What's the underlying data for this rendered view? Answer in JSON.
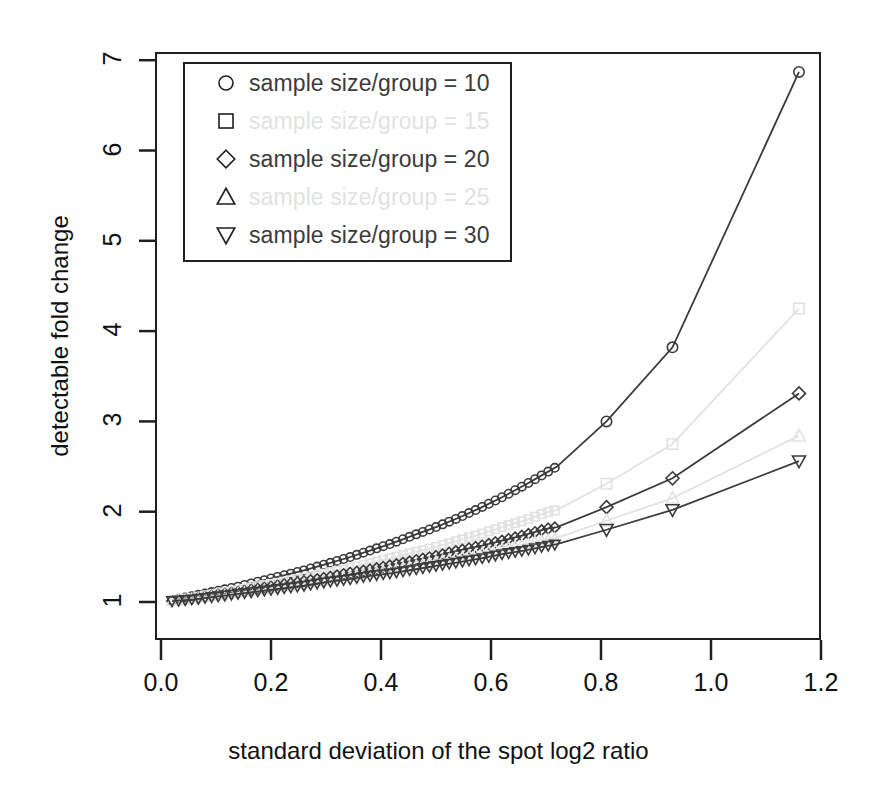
{
  "figure": {
    "title_fragment": "",
    "background": "#ffffff",
    "frame_color": "#1f1f1f"
  },
  "axes": {
    "x_title": "standard deviation of the spot log2 ratio",
    "y_title": "detectable fold change",
    "x_ticks": [
      "0.0",
      "0.2",
      "0.4",
      "0.6",
      "0.8",
      "1.0",
      "1.2"
    ],
    "y_ticks": [
      "1",
      "2",
      "3",
      "4",
      "5",
      "6",
      "7"
    ]
  },
  "legend": {
    "items": [
      {
        "symbol": "circle",
        "label": "sample size/group = 10",
        "color": "#3b3b3b",
        "faded": false
      },
      {
        "symbol": "square",
        "label": "sample size/group = 15",
        "color": "#e2e2e2",
        "faded": true
      },
      {
        "symbol": "diamond",
        "label": "sample size/group = 20",
        "color": "#3b3b3b",
        "faded": false
      },
      {
        "symbol": "triangle-up",
        "label": "sample size/group = 25",
        "color": "#e2e2e2",
        "faded": true
      },
      {
        "symbol": "triangle-down",
        "label": "sample size/group = 30",
        "color": "#3b3b3b",
        "faded": false
      }
    ]
  },
  "chart_data": {
    "type": "line",
    "title": "",
    "xlabel": "standard deviation of the spot log2 ratio",
    "ylabel": "detectable fold change",
    "xlim": [
      -0.02,
      1.22
    ],
    "ylim": [
      0.88,
      7.1
    ],
    "xticks": [
      0.0,
      0.2,
      0.4,
      0.6,
      0.8,
      1.0,
      1.2
    ],
    "yticks": [
      1,
      2,
      3,
      4,
      5,
      6,
      7
    ],
    "grid": false,
    "legend_position": "top-left",
    "x": [
      0.02,
      0.06,
      0.1,
      0.14,
      0.18,
      0.22,
      0.26,
      0.3,
      0.34,
      0.38,
      0.42,
      0.46,
      0.5,
      0.54,
      0.58,
      0.62,
      0.66,
      0.7,
      0.72,
      0.81,
      0.93,
      1.16
    ],
    "series": [
      {
        "name": "sample size/group = 10",
        "symbol": "circle",
        "color": "#3b3b3b",
        "faded": false,
        "values": [
          1.02,
          1.07,
          1.12,
          1.17,
          1.23,
          1.29,
          1.35,
          1.42,
          1.49,
          1.57,
          1.65,
          1.74,
          1.83,
          1.93,
          2.04,
          2.16,
          2.29,
          2.43,
          2.5,
          3.0,
          3.82,
          6.87
        ]
      },
      {
        "name": "sample size/group = 15",
        "symbol": "square",
        "color": "#e2e2e2",
        "faded": true,
        "values": [
          1.02,
          1.05,
          1.09,
          1.13,
          1.18,
          1.22,
          1.27,
          1.32,
          1.37,
          1.43,
          1.49,
          1.55,
          1.61,
          1.68,
          1.75,
          1.83,
          1.9,
          1.99,
          2.02,
          2.31,
          2.75,
          4.25
        ]
      },
      {
        "name": "sample size/group = 20",
        "symbol": "diamond",
        "color": "#3b3b3b",
        "faded": false,
        "values": [
          1.01,
          1.04,
          1.08,
          1.11,
          1.15,
          1.19,
          1.23,
          1.27,
          1.32,
          1.36,
          1.41,
          1.46,
          1.51,
          1.57,
          1.62,
          1.68,
          1.74,
          1.81,
          1.83,
          2.05,
          2.37,
          3.31
        ]
      },
      {
        "name": "sample size/group = 25",
        "symbol": "triangle-up",
        "color": "#e2e2e2",
        "faded": true,
        "values": [
          1.01,
          1.04,
          1.07,
          1.1,
          1.13,
          1.17,
          1.2,
          1.24,
          1.28,
          1.32,
          1.36,
          1.4,
          1.45,
          1.49,
          1.54,
          1.59,
          1.64,
          1.69,
          1.71,
          1.9,
          2.15,
          2.84
        ]
      },
      {
        "name": "sample size/group = 30",
        "symbol": "triangle-down",
        "color": "#3b3b3b",
        "faded": false,
        "values": [
          1.01,
          1.03,
          1.06,
          1.09,
          1.12,
          1.15,
          1.18,
          1.22,
          1.25,
          1.29,
          1.32,
          1.36,
          1.4,
          1.44,
          1.48,
          1.53,
          1.57,
          1.62,
          1.64,
          1.8,
          2.02,
          2.56
        ]
      }
    ]
  }
}
